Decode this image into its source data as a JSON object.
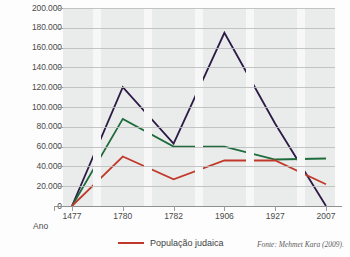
{
  "axis": {
    "x_title": "Ano",
    "y_ticks": [
      "200.000",
      "180.000",
      "160.000",
      "140.000",
      "120.000",
      "100.000",
      "80.000",
      "60.000",
      "40.000",
      "20.000",
      "0"
    ],
    "x_ticks": [
      "1477",
      "1780",
      "1782",
      "1906",
      "1927",
      "2007"
    ]
  },
  "legend": {
    "items": [
      {
        "label": "População judaica",
        "color": "#c0392b"
      }
    ]
  },
  "source": {
    "text": "Fonte: Mehmet Kara (2009)."
  },
  "colors": {
    "series_purple": "#2e1a47",
    "series_green": "#1f6b3b",
    "series_red": "#c0392b",
    "plot_background": "#e9ecea",
    "gridline": "#b9bcbb",
    "band": "#f6f7f6",
    "text": "#4a4a4a"
  },
  "chart_data": {
    "type": "line",
    "title": "",
    "xlabel": "Ano",
    "ylabel": "",
    "x": [
      "1477",
      "1780",
      "1782",
      "1906",
      "1927",
      "2007"
    ],
    "categories": [
      "1477",
      "1780",
      "1782",
      "1906",
      "1927",
      "2007"
    ],
    "ylim": [
      0,
      200000
    ],
    "ytick_values": [
      0,
      20000,
      40000,
      60000,
      80000,
      100000,
      120000,
      140000,
      160000,
      180000,
      200000
    ],
    "ytick_labels": [
      "0",
      "20.000",
      "40.000",
      "60.000",
      "80.000",
      "100.000",
      "120.000",
      "140.000",
      "160.000",
      "180.000",
      "200.000"
    ],
    "grid": true,
    "legend_position": "bottom-center",
    "series": [
      {
        "name": "série-roxa",
        "color": "#2e1a47",
        "values": [
          0,
          120000,
          63000,
          175000,
          83000,
          0
        ]
      },
      {
        "name": "série-verde",
        "color": "#1f6b3b",
        "values": [
          0,
          88000,
          60000,
          60000,
          47000,
          48000
        ]
      },
      {
        "name": "População judaica",
        "color": "#c0392b",
        "values": [
          0,
          50000,
          27000,
          46000,
          46000,
          22000
        ]
      }
    ]
  }
}
